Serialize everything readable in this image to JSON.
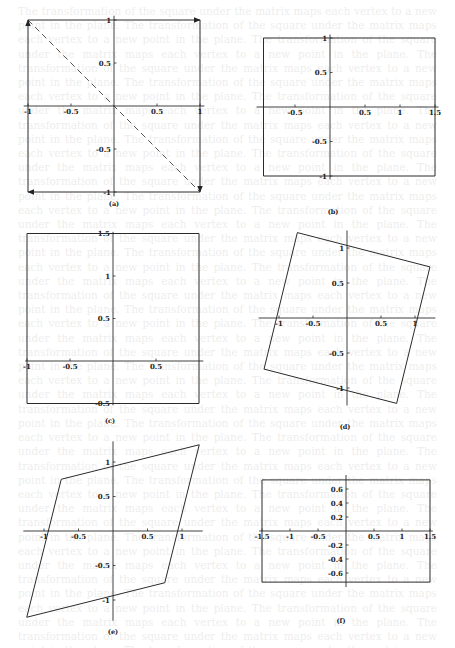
{
  "page": {
    "background_text": "lines of faint bleed-through body text from the reverse side of the page"
  },
  "panels": [
    {
      "id": "a",
      "caption": "(a)",
      "origin": [
        114,
        106
      ],
      "scale": [
        86,
        86
      ],
      "x_ticks": [
        {
          "v": -1,
          "label": "-1"
        },
        {
          "v": -0.5,
          "label": "-0.5"
        },
        {
          "v": 0.5,
          "label": "0.5"
        },
        {
          "v": 1,
          "label": "1"
        }
      ],
      "y_ticks": [
        {
          "v": 1,
          "label": "1"
        },
        {
          "v": 0.5,
          "label": "0.5"
        },
        {
          "v": -0.5,
          "label": "-0.5"
        },
        {
          "v": -1,
          "label": "-1"
        }
      ],
      "x_axis": [
        -1.05,
        1.05
      ],
      "y_axis": [
        -1.05,
        1.05
      ],
      "shape": [
        [
          -1,
          1
        ],
        [
          1,
          1
        ],
        [
          1,
          -1
        ],
        [
          -1,
          -1
        ]
      ],
      "arrows": [
        {
          "from": [
            -1,
            1
          ],
          "to": [
            1,
            1
          ]
        },
        {
          "from": [
            1,
            1
          ],
          "to": [
            1,
            -1
          ]
        },
        {
          "from": [
            1,
            -1
          ],
          "to": [
            -1,
            -1
          ]
        },
        {
          "from": [
            -1,
            -1
          ],
          "to": [
            -1,
            1
          ]
        }
      ],
      "dashed": [
        [
          -1,
          1
        ],
        [
          1,
          -1
        ]
      ],
      "caption_pos": [
        114,
        206
      ]
    },
    {
      "id": "b",
      "caption": "(b)",
      "origin": [
        330,
        107
      ],
      "scale": [
        70,
        69
      ],
      "x_ticks": [
        {
          "v": -0.5,
          "label": "-0.5"
        },
        {
          "v": 0.5,
          "label": "0.5"
        },
        {
          "v": 1,
          "label": "1"
        },
        {
          "v": 1.5,
          "label": "1.5"
        }
      ],
      "y_ticks": [
        {
          "v": 1,
          "label": "1"
        },
        {
          "v": 0.5,
          "label": "0.5"
        },
        {
          "v": -0.5,
          "label": "-0.5"
        },
        {
          "v": -1,
          "label": "-1"
        }
      ],
      "x_axis": [
        -1.05,
        1.55
      ],
      "y_axis": [
        -1.05,
        1.05
      ],
      "shape": [
        [
          -0.95,
          1
        ],
        [
          1.5,
          1
        ],
        [
          1.5,
          -1
        ],
        [
          -0.95,
          -1
        ]
      ],
      "caption_pos": [
        333,
        214
      ]
    },
    {
      "id": "c",
      "caption": "(c)",
      "origin": [
        113,
        361
      ],
      "scale": [
        86,
        85
      ],
      "x_ticks": [
        {
          "v": -1,
          "label": "-1"
        },
        {
          "v": -0.5,
          "label": "-0.5"
        },
        {
          "v": 0.5,
          "label": "0.5"
        }
      ],
      "y_ticks": [
        {
          "v": 1.5,
          "label": "1.5"
        },
        {
          "v": 1,
          "label": "1"
        },
        {
          "v": 0.5,
          "label": "0.5"
        },
        {
          "v": -0.5,
          "label": "-0.5"
        }
      ],
      "x_axis": [
        -1.02,
        1.05
      ],
      "y_axis": [
        -0.52,
        1.52
      ],
      "shape": [
        [
          -1,
          1.5
        ],
        [
          1,
          1.5
        ],
        [
          1,
          -0.5
        ],
        [
          -1,
          -0.5
        ]
      ],
      "caption_pos": [
        110,
        423
      ]
    },
    {
      "id": "d",
      "caption": "(d)",
      "origin": [
        347,
        318
      ],
      "scale": [
        68,
        70
      ],
      "x_ticks": [
        {
          "v": -1,
          "label": "-1"
        },
        {
          "v": -0.5,
          "label": "-0.5"
        },
        {
          "v": 0.5,
          "label": "0.5"
        },
        {
          "v": 1,
          "label": "1"
        }
      ],
      "y_ticks": [
        {
          "v": 1,
          "label": "1"
        },
        {
          "v": 0.5,
          "label": "0.5"
        },
        {
          "v": -0.5,
          "label": "-0.5"
        },
        {
          "v": -1,
          "label": "-1"
        }
      ],
      "x_axis": [
        -1.3,
        1.3
      ],
      "y_axis": [
        -1.25,
        1.25
      ],
      "shape": [
        [
          -0.73,
          1.22
        ],
        [
          1.22,
          0.73
        ],
        [
          0.73,
          -1.22
        ],
        [
          -1.22,
          -0.73
        ]
      ],
      "caption_pos": [
        345,
        429
      ]
    },
    {
      "id": "e",
      "caption": "(e)",
      "origin": [
        113,
        531
      ],
      "scale": [
        69,
        69
      ],
      "x_ticks": [
        {
          "v": -1,
          "label": "-1"
        },
        {
          "v": -0.5,
          "label": "-0.5"
        },
        {
          "v": 0.5,
          "label": "0.5"
        },
        {
          "v": 1,
          "label": "1"
        }
      ],
      "y_ticks": [
        {
          "v": 1,
          "label": "1"
        },
        {
          "v": 0.5,
          "label": "0.5"
        },
        {
          "v": -0.5,
          "label": "-0.5"
        },
        {
          "v": -1,
          "label": "-1"
        }
      ],
      "x_axis": [
        -1.3,
        1.3
      ],
      "y_axis": [
        -1.3,
        1.3
      ],
      "shape": [
        [
          -0.75,
          0.75
        ],
        [
          1.25,
          1.25
        ],
        [
          0.75,
          -0.75
        ],
        [
          -1.25,
          -1.25
        ]
      ],
      "caption_pos": [
        113,
        634
      ]
    },
    {
      "id": "f",
      "caption": "(f)",
      "origin": [
        346,
        531
      ],
      "scale": [
        56,
        70
      ],
      "x_ticks": [
        {
          "v": -1.5,
          "label": "-1.5"
        },
        {
          "v": -1,
          "label": "-1"
        },
        {
          "v": -0.5,
          "label": "-0.5"
        },
        {
          "v": 0.5,
          "label": "0.5"
        },
        {
          "v": 1,
          "label": "1"
        },
        {
          "v": 1.5,
          "label": "1.5"
        }
      ],
      "y_ticks": [
        {
          "v": 0.6,
          "label": "0.6"
        },
        {
          "v": 0.4,
          "label": "0.4"
        },
        {
          "v": 0.2,
          "label": "0.2"
        },
        {
          "v": -0.2,
          "label": "-0.2"
        },
        {
          "v": -0.4,
          "label": "-0.4"
        },
        {
          "v": -0.6,
          "label": "-0.6"
        }
      ],
      "x_axis": [
        -1.55,
        1.55
      ],
      "y_axis": [
        -0.8,
        0.8
      ],
      "shape": [
        [
          -1.5,
          0.73
        ],
        [
          1.5,
          0.73
        ],
        [
          1.5,
          -0.73
        ],
        [
          -1.5,
          -0.73
        ]
      ],
      "caption_pos": [
        341,
        623
      ]
    }
  ]
}
